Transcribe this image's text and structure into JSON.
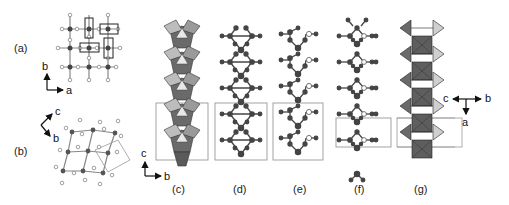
{
  "figure": {
    "panels": [
      {
        "id": "a",
        "label": "(a)",
        "axes": {
          "vertical": "b",
          "horizontal": "a"
        }
      },
      {
        "id": "b",
        "label": "(b)",
        "axes": {
          "up_right": "c",
          "down_right": "b"
        }
      },
      {
        "id": "c",
        "label": "(c)",
        "axes": {
          "vertical": "c",
          "horizontal": "b"
        }
      },
      {
        "id": "d",
        "label": "(d)"
      },
      {
        "id": "e",
        "label": "(e)"
      },
      {
        "id": "f",
        "label": "(f)"
      },
      {
        "id": "g",
        "label": "(g)",
        "axes": {
          "left": "c",
          "right": "b",
          "down": "a"
        }
      }
    ]
  },
  "colors": {
    "atom_dark": "#3a3a3a",
    "atom_open": "#ffffff",
    "polyhedron_dark": "#6b6b6b",
    "polyhedron_light": "#c8c8c8",
    "cell_box": "#8a8a8a"
  }
}
